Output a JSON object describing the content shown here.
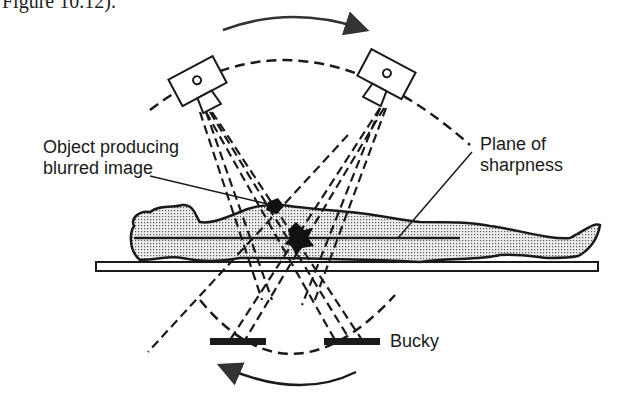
{
  "figure": {
    "caption_fragment": "Figure 10.12).",
    "labels": {
      "object": [
        "Object producing",
        "blurred image"
      ],
      "plane": [
        "Plane of",
        "sharpness"
      ],
      "bucky": "Bucky"
    },
    "elements": {
      "tube_left": "x-ray-tube",
      "tube_right": "x-ray-tube",
      "patient": "patient-lying-supine",
      "table": "examination-table",
      "bucky_left": "bucky-film",
      "bucky_right": "bucky-film",
      "arrow_top": "tube-movement-arrow",
      "arrow_bottom": "bucky-movement-arrow"
    },
    "colors": {
      "ink": "#1a1a1a",
      "body_fill": "#d8d8d8",
      "background": "#ffffff"
    }
  }
}
